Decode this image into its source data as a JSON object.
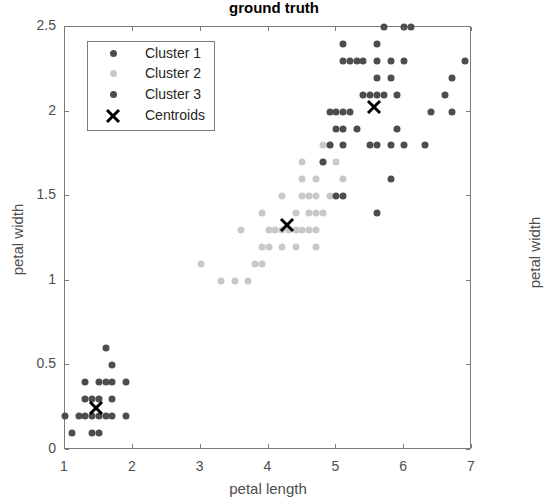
{
  "chart_data": {
    "type": "scatter",
    "title": "ground truth",
    "xlabel": "petal length",
    "ylabel": "petal width",
    "ylabel_right": "petal width",
    "xlim": [
      1,
      7
    ],
    "ylim": [
      0,
      2.5
    ],
    "xticks": [
      "1",
      "2",
      "3",
      "4",
      "5",
      "6",
      "7"
    ],
    "yticks": [
      "0",
      "0.5",
      "1",
      "1.5",
      "2",
      "2.5"
    ],
    "grid": false,
    "legend_position": "upper left",
    "legend": [
      {
        "label": "Cluster 1",
        "color": "#4d4d4d",
        "marker": "dot"
      },
      {
        "label": "Cluster 2",
        "color": "#c8c8c8",
        "marker": "dot"
      },
      {
        "label": "Cluster 3",
        "color": "#4d4d4d",
        "marker": "dot"
      },
      {
        "label": "Centroids",
        "color": "#000000",
        "marker": "x"
      }
    ],
    "series": [
      {
        "name": "Cluster 1",
        "color": "#4d4d4d",
        "points": [
          [
            1.0,
            0.2
          ],
          [
            1.1,
            0.1
          ],
          [
            1.2,
            0.2
          ],
          [
            1.3,
            0.2
          ],
          [
            1.4,
            0.2
          ],
          [
            1.4,
            0.1
          ],
          [
            1.5,
            0.2
          ],
          [
            1.5,
            0.1
          ],
          [
            1.6,
            0.2
          ],
          [
            1.7,
            0.2
          ],
          [
            1.9,
            0.2
          ],
          [
            1.3,
            0.3
          ],
          [
            1.4,
            0.3
          ],
          [
            1.5,
            0.3
          ],
          [
            1.7,
            0.3
          ],
          [
            1.3,
            0.4
          ],
          [
            1.5,
            0.4
          ],
          [
            1.6,
            0.4
          ],
          [
            1.7,
            0.4
          ],
          [
            1.9,
            0.4
          ],
          [
            1.7,
            0.5
          ],
          [
            1.6,
            0.6
          ]
        ]
      },
      {
        "name": "Cluster 2",
        "color": "#c8c8c8",
        "points": [
          [
            3.0,
            1.1
          ],
          [
            3.3,
            1.0
          ],
          [
            3.5,
            1.0
          ],
          [
            3.7,
            1.0
          ],
          [
            3.9,
            1.1
          ],
          [
            3.8,
            1.1
          ],
          [
            3.9,
            1.2
          ],
          [
            4.0,
            1.2
          ],
          [
            4.2,
            1.2
          ],
          [
            4.4,
            1.2
          ],
          [
            4.7,
            1.2
          ],
          [
            3.6,
            1.3
          ],
          [
            4.0,
            1.3
          ],
          [
            4.1,
            1.3
          ],
          [
            4.2,
            1.3
          ],
          [
            4.3,
            1.3
          ],
          [
            4.4,
            1.3
          ],
          [
            4.5,
            1.3
          ],
          [
            4.6,
            1.3
          ],
          [
            4.7,
            1.3
          ],
          [
            3.9,
            1.4
          ],
          [
            4.4,
            1.4
          ],
          [
            4.6,
            1.4
          ],
          [
            4.7,
            1.4
          ],
          [
            4.8,
            1.4
          ],
          [
            4.2,
            1.5
          ],
          [
            4.5,
            1.5
          ],
          [
            4.6,
            1.5
          ],
          [
            4.7,
            1.5
          ],
          [
            4.9,
            1.5
          ],
          [
            4.5,
            1.6
          ],
          [
            4.7,
            1.6
          ],
          [
            5.1,
            1.6
          ],
          [
            4.8,
            1.8
          ],
          [
            4.5,
            1.7
          ],
          [
            4.8,
            1.7
          ],
          [
            5.0,
            1.7
          ],
          [
            4.9,
            1.8
          ]
        ]
      },
      {
        "name": "Cluster 3",
        "color": "#4d4d4d",
        "points": [
          [
            5.0,
            1.5
          ],
          [
            5.1,
            1.5
          ],
          [
            4.8,
            1.7
          ],
          [
            5.6,
            1.4
          ],
          [
            5.8,
            1.6
          ],
          [
            4.9,
            1.8
          ],
          [
            5.1,
            1.8
          ],
          [
            5.5,
            1.8
          ],
          [
            5.6,
            1.8
          ],
          [
            5.8,
            1.8
          ],
          [
            6.0,
            1.8
          ],
          [
            6.3,
            1.8
          ],
          [
            5.0,
            1.9
          ],
          [
            5.1,
            1.9
          ],
          [
            5.3,
            1.9
          ],
          [
            5.9,
            1.9
          ],
          [
            4.9,
            2.0
          ],
          [
            5.0,
            2.0
          ],
          [
            5.1,
            2.0
          ],
          [
            5.2,
            2.0
          ],
          [
            6.7,
            2.0
          ],
          [
            6.4,
            2.0
          ],
          [
            5.4,
            2.1
          ],
          [
            5.5,
            2.1
          ],
          [
            5.6,
            2.1
          ],
          [
            5.7,
            2.1
          ],
          [
            5.9,
            2.1
          ],
          [
            6.6,
            2.1
          ],
          [
            5.6,
            2.2
          ],
          [
            5.8,
            2.2
          ],
          [
            6.7,
            2.2
          ],
          [
            5.1,
            2.3
          ],
          [
            5.2,
            2.3
          ],
          [
            5.3,
            2.3
          ],
          [
            5.4,
            2.3
          ],
          [
            5.6,
            2.3
          ],
          [
            5.8,
            2.3
          ],
          [
            6.0,
            2.3
          ],
          [
            6.9,
            2.3
          ],
          [
            5.1,
            2.4
          ],
          [
            5.6,
            2.4
          ],
          [
            5.7,
            2.5
          ],
          [
            6.0,
            2.5
          ],
          [
            6.1,
            2.5
          ]
        ]
      }
    ],
    "centroids": [
      [
        1.46,
        0.25
      ],
      [
        4.27,
        1.33
      ],
      [
        5.55,
        2.03
      ]
    ]
  }
}
